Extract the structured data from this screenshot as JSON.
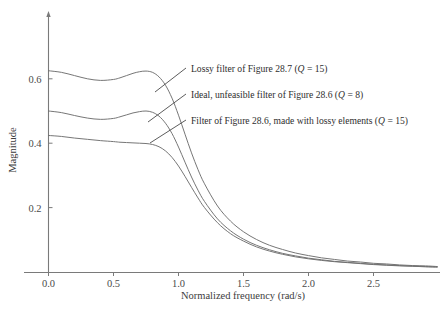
{
  "figure": {
    "background": "#ffffff",
    "line_color": "#6f6f6f",
    "axis_color": "#7a7a7a",
    "text_color": "#3c3c3c"
  },
  "chart_data": {
    "type": "line",
    "title": "",
    "xlabel": "Normalized frequency (rad/s)",
    "ylabel": "Magnitude",
    "xlim": [
      0.0,
      2.99
    ],
    "ylim": [
      0.0,
      0.85
    ],
    "xticks": [
      "0.0",
      "0.5",
      "1.0",
      "1.5",
      "2.0",
      "2.5"
    ],
    "xtick_values": [
      0.0,
      0.5,
      1.0,
      1.5,
      2.0,
      2.5
    ],
    "yticks": [
      "0.2",
      "0.4",
      "0.6"
    ],
    "ytick_values": [
      0.2,
      0.4,
      0.6
    ],
    "grid": false,
    "legend": "annotations-with-leader-lines",
    "x": [
      0.0,
      0.1,
      0.2,
      0.3,
      0.4,
      0.5,
      0.55,
      0.6,
      0.65,
      0.7,
      0.75,
      0.8,
      0.85,
      0.9,
      0.95,
      1.0,
      1.05,
      1.1,
      1.15,
      1.2,
      1.3,
      1.4,
      1.5,
      1.6,
      1.7,
      1.8,
      1.9,
      2.0,
      2.1,
      2.2,
      2.3,
      2.4,
      2.5,
      2.6,
      2.7,
      2.8,
      2.9,
      2.99
    ],
    "series": [
      {
        "name": "Lossy filter of Figure 28.7 (Q = 15)",
        "label_plain": "Lossy filter of Figure 28.7 (Q = 15)",
        "Q": 15,
        "values": [
          0.625,
          0.62,
          0.61,
          0.6,
          0.595,
          0.598,
          0.603,
          0.61,
          0.617,
          0.622,
          0.624,
          0.62,
          0.606,
          0.58,
          0.54,
          0.487,
          0.428,
          0.37,
          0.318,
          0.274,
          0.205,
          0.158,
          0.125,
          0.101,
          0.083,
          0.07,
          0.059,
          0.051,
          0.044,
          0.039,
          0.034,
          0.031,
          0.027,
          0.025,
          0.022,
          0.02,
          0.019,
          0.017
        ]
      },
      {
        "name": "Ideal, unfeasible filter of Figure 28.6 (Q = 8)",
        "label_plain": "Ideal, unfeasible filter of Figure 28.6 (Q = 8)",
        "Q": 8,
        "values": [
          0.5,
          0.495,
          0.486,
          0.478,
          0.474,
          0.477,
          0.482,
          0.488,
          0.494,
          0.498,
          0.5,
          0.496,
          0.484,
          0.462,
          0.43,
          0.388,
          0.341,
          0.295,
          0.254,
          0.219,
          0.165,
          0.128,
          0.102,
          0.083,
          0.069,
          0.058,
          0.05,
          0.043,
          0.038,
          0.033,
          0.03,
          0.027,
          0.024,
          0.022,
          0.02,
          0.018,
          0.017,
          0.016
        ]
      },
      {
        "name": "Filter of Figure 28.6, made with lossy elements (Q = 15)",
        "label_plain": "Filter of Figure 28.6, made with lossy elements (Q = 15)",
        "Q": 15,
        "values": [
          0.424,
          0.421,
          0.416,
          0.412,
          0.408,
          0.405,
          0.403,
          0.402,
          0.401,
          0.4,
          0.399,
          0.396,
          0.389,
          0.376,
          0.356,
          0.329,
          0.297,
          0.263,
          0.23,
          0.2,
          0.153,
          0.119,
          0.096,
          0.078,
          0.065,
          0.055,
          0.047,
          0.041,
          0.036,
          0.032,
          0.029,
          0.026,
          0.023,
          0.021,
          0.019,
          0.018,
          0.016,
          0.015
        ]
      }
    ],
    "annotations": [
      {
        "id": "annot-lossy-287",
        "text_prefix": "Lossy filter of Figure 28.7 (",
        "text_italic": "Q",
        "text_suffix": " = 15)",
        "full_text": "Lossy filter of Figure 28.7 (Q = 15)",
        "text_x": 191,
        "text_y": 72,
        "leader": {
          "x1": 186,
          "y1": 68,
          "x2": 155,
          "y2": 92
        }
      },
      {
        "id": "annot-ideal-286",
        "text_prefix": "Ideal, unfeasible filter of Figure 28.6 (",
        "text_italic": "Q",
        "text_suffix": " = 8)",
        "full_text": "Ideal, unfeasible filter of Figure 28.6 (Q = 8)",
        "text_x": 191,
        "text_y": 98,
        "leader": {
          "x1": 186,
          "y1": 94,
          "x2": 148,
          "y2": 122
        }
      },
      {
        "id": "annot-lossy-elements",
        "text_prefix": "Filter of Figure 28.6, made with lossy elements (",
        "text_italic": "Q",
        "text_suffix": " = 15)",
        "full_text": "Filter of Figure 28.6, made with lossy elements (Q = 15)",
        "text_x": 191,
        "text_y": 124,
        "leader": {
          "x1": 186,
          "y1": 120,
          "x2": 150,
          "y2": 143
        }
      }
    ]
  }
}
